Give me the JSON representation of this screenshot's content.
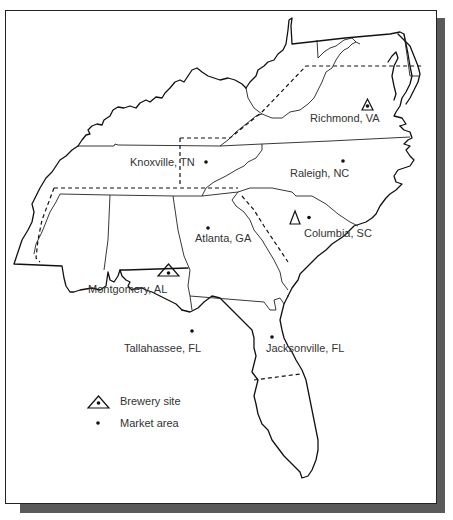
{
  "map": {
    "region": "Southeastern United States",
    "cities": [
      {
        "name": "Richmond, VA",
        "type": "brewery"
      },
      {
        "name": "Knoxville, TN",
        "type": "market"
      },
      {
        "name": "Raleigh, NC",
        "type": "market"
      },
      {
        "name": "Atlanta, GA",
        "type": "market"
      },
      {
        "name": "Columbia, SC",
        "type": "brewery"
      },
      {
        "name": "Montgomery, AL",
        "type": "brewery"
      },
      {
        "name": "Tallahassee, FL",
        "type": "market"
      },
      {
        "name": "Jacksonville, FL",
        "type": "market"
      }
    ]
  },
  "legend": {
    "brewery_label": "Brewery site",
    "market_label": "Market area"
  },
  "colors": {
    "line": "#111111",
    "shadow": "#5a5a5a",
    "text": "#333333"
  }
}
